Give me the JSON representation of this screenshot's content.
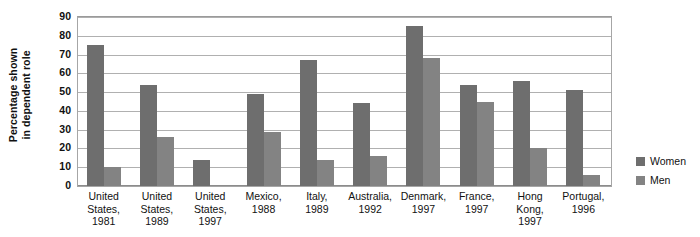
{
  "chart_data": {
    "type": "bar",
    "title": "",
    "subtitle": "",
    "xlabel": "",
    "ylabel_lines": [
      "Percentage shown",
      "in dependent role"
    ],
    "ylabel": "Percentage shown in dependent role",
    "ylim": [
      0,
      90
    ],
    "ytick_step": 10,
    "yticks": [
      90,
      80,
      70,
      60,
      50,
      40,
      30,
      20,
      10,
      0
    ],
    "ytick_labels": [
      "90",
      "80",
      "70",
      "60",
      "50",
      "40",
      "30",
      "20",
      "10",
      "0"
    ],
    "grid": true,
    "grid_axis": "y",
    "legend_position": "right",
    "categories": [
      "United States, 1981",
      "United States, 1989",
      "United States, 1997",
      "Mexico, 1988",
      "Italy, 1989",
      "Australia, 1992",
      "Denmark, 1997",
      "France, 1997",
      "Hong Kong, 1997",
      "Portugal, 1996"
    ],
    "category_label_lines": [
      [
        "United",
        "States,",
        "1981"
      ],
      [
        "United",
        "States,",
        "1989"
      ],
      [
        "United",
        "States,",
        "1997"
      ],
      [
        "Mexico,",
        "1988"
      ],
      [
        "Italy,",
        "1989"
      ],
      [
        "Australia,",
        "1992"
      ],
      [
        "Denmark,",
        "1997"
      ],
      [
        "France,",
        "1997"
      ],
      [
        "Hong",
        "Kong,",
        "1997"
      ],
      [
        "Portugal,",
        "1996"
      ]
    ],
    "series": [
      {
        "name": "Women",
        "color": "#6e6e6e",
        "values": [
          75,
          54,
          14,
          49,
          67,
          44,
          85,
          54,
          56,
          51
        ]
      },
      {
        "name": "Men",
        "color": "#838383",
        "values": [
          10,
          26,
          null,
          29,
          14,
          16,
          68,
          45,
          20,
          6
        ]
      }
    ]
  },
  "legend": {
    "items": [
      {
        "label": "Women",
        "color": "#6e6e6e"
      },
      {
        "label": "Men",
        "color": "#838383"
      }
    ]
  },
  "colors": {
    "women": "#6e6e6e",
    "men": "#838383",
    "gridline": "#b0b0b0",
    "axis": "#a6a6a6",
    "background": "#ffffff",
    "text": "#111111"
  }
}
